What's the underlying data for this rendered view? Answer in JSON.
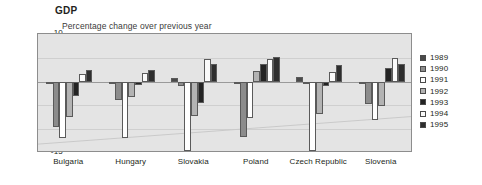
{
  "chart_data": {
    "type": "bar",
    "title": "GDP",
    "subtitle": "Percentage change over previous year",
    "xlabel": "",
    "ylabel": "",
    "ylim": [
      -15,
      10
    ],
    "yticks": [
      "10",
      "5",
      "0",
      "-5",
      "-10",
      "-15"
    ],
    "grid": true,
    "legend_position": "right",
    "categories": [
      "Bulgaria",
      "Hungary",
      "Slovakia",
      "Poland",
      "Czech Republic",
      "Slovenia"
    ],
    "series": [
      {
        "name": "1989",
        "color": "#4a4a4a",
        "values": [
          -0.5,
          -0.5,
          0.7,
          -0.3,
          1.0,
          -0.2
        ]
      },
      {
        "name": "1990",
        "color": "#8c8c8c",
        "values": [
          -9.5,
          -3.8,
          -1.0,
          -11.6,
          -0.5,
          -4.7
        ]
      },
      {
        "name": "1991",
        "color": "#ffffff",
        "values": [
          -11.8,
          -11.9,
          -14.6,
          -7.6,
          -14.5,
          -8.1
        ]
      },
      {
        "name": "1992",
        "color": "#b3b3b3",
        "values": [
          -7.5,
          -3.2,
          -7.3,
          2.2,
          -6.8,
          -5.2
        ]
      },
      {
        "name": "1993",
        "color": "#232323",
        "values": [
          -3.0,
          -0.8,
          -4.4,
          3.8,
          -0.9,
          2.8
        ]
      },
      {
        "name": "1994",
        "color": "#fafafa",
        "values": [
          1.5,
          1.8,
          4.7,
          4.8,
          2.0,
          5.0
        ]
      },
      {
        "name": "1995",
        "color": "#2e2e2e",
        "values": [
          2.5,
          2.5,
          3.8,
          5.2,
          3.5,
          3.8
        ]
      }
    ]
  },
  "legend": {
    "items": [
      {
        "label": "1989"
      },
      {
        "label": "1990"
      },
      {
        "label": "1991"
      },
      {
        "label": "1992"
      },
      {
        "label": "1993"
      },
      {
        "label": "1994"
      },
      {
        "label": "1995"
      }
    ]
  },
  "axis": {
    "y": [
      {
        "label": "10"
      },
      {
        "label": "5"
      },
      {
        "label": "0"
      },
      {
        "label": "-5"
      },
      {
        "label": "-10"
      },
      {
        "label": "-15"
      }
    ],
    "x": [
      {
        "label": "Bulgaria"
      },
      {
        "label": "Hungary"
      },
      {
        "label": "Slovakia"
      },
      {
        "label": "Poland"
      },
      {
        "label": "Czech Republic"
      },
      {
        "label": "Slovenia"
      }
    ]
  }
}
